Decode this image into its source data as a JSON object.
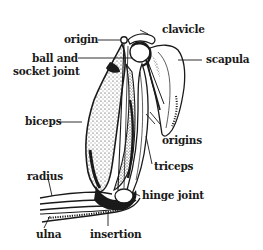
{
  "diagram": {
    "labels": {
      "origin": "origin",
      "ball_socket_line1": "ball and",
      "ball_socket_line2": "socket joint",
      "biceps": "biceps",
      "radius": "radius",
      "ulna": "ulna",
      "insertion": "insertion",
      "hinge_joint": "hinge joint",
      "triceps": "triceps",
      "origins": "origins",
      "clavicle": "clavicle",
      "scapula": "scapula"
    },
    "colors": {
      "ink": "#1a1a1a",
      "background": "#ffffff"
    }
  }
}
